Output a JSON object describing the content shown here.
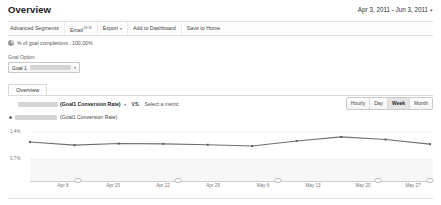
{
  "header": {
    "title": "Overview",
    "date_range": "Apr 3, 2011 - Jun 3, 2011",
    "date_range_caret": "▾"
  },
  "action_bar": {
    "items": [
      {
        "label": "Advanced Segments",
        "sup": "",
        "caret": ""
      },
      {
        "label": "Email",
        "sup": "BETA",
        "caret": ""
      },
      {
        "label": "Export",
        "sup": "",
        "caret": "▾"
      },
      {
        "label": "Add to Dashboard",
        "sup": "",
        "caret": ""
      },
      {
        "label": "Save to Home",
        "sup": "",
        "caret": ""
      }
    ]
  },
  "goal_completions": {
    "icon": "pie-chart-icon",
    "text": "% of goal completions : 100.00%"
  },
  "goal_option": {
    "label": "Goal Option",
    "selected": "Goal 1",
    "caret": "▾"
  },
  "panel": {
    "tab_label": "Overview",
    "metric": {
      "name": "(Goal1 Conversion Rate)",
      "caret": "▾"
    },
    "vs_label": "VS.",
    "select_metric": "Select a metric",
    "granularity": {
      "options": [
        "Hourly",
        "Day",
        "Week",
        "Month"
      ],
      "selected": "Week"
    },
    "legend": {
      "marker_color": "#6a6a6a",
      "text": "(Goal1 Conversion Rate)"
    }
  },
  "chart_data": {
    "type": "line",
    "title": "(Goal1 Conversion Rate)",
    "xlabel": "",
    "ylabel": "",
    "x": [
      "Apr 3",
      "Apr 8",
      "Apr 15",
      "Apr 22",
      "Apr 29",
      "May 6",
      "May 13",
      "May 20",
      "May 27",
      "Jun 3"
    ],
    "tick_labels": [
      "Apr 8",
      "Apr 15",
      "Apr 22",
      "Apr 29",
      "May 6",
      "May 13",
      "May 20",
      "May 27"
    ],
    "values": [
      1.02,
      0.92,
      0.97,
      0.96,
      0.93,
      0.89,
      1.05,
      1.18,
      1.1,
      0.95
    ],
    "ylim": [
      0,
      1.4
    ],
    "ytick_labels": [
      "1.4%",
      "0.7%"
    ],
    "ytick_values": [
      1.4,
      0.7
    ],
    "grid": false,
    "legend_position": "top-left",
    "line_color": "#6f6f6f",
    "marker_color": "#5f5f5f",
    "series_name": "(Goal1 Conversion Rate)"
  }
}
